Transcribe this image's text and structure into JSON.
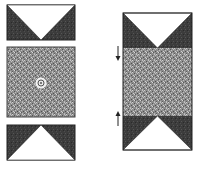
{
  "figure": {
    "width": 209,
    "height": 171,
    "background": "#ffffff",
    "colors": {
      "dark_fill": "#3a3a3a",
      "speckle_base": "#8a8a8a",
      "speckle_light": "#c8c8c8",
      "speckle_dark": "#4a4a4a",
      "light_fill": "#ffffff",
      "stroke": "#222222"
    },
    "left_panel": {
      "top_block": {
        "x": 7,
        "y": 5,
        "w": 68,
        "h": 35,
        "triangle": "down-pointing white"
      },
      "middle_block": {
        "x": 7,
        "y": 47,
        "w": 68,
        "h": 70,
        "fill": "speckled",
        "center_marker": "circle-target"
      },
      "bottom_block": {
        "x": 7,
        "y": 125,
        "w": 68,
        "h": 35,
        "triangle": "up-pointing white"
      }
    },
    "right_panel": {
      "x": 123,
      "y": 13,
      "w": 69,
      "h": 137,
      "top_section": {
        "y": 13,
        "h": 35,
        "triangle": "down-pointing white"
      },
      "middle_section": {
        "y": 48,
        "h": 68,
        "fill": "speckled"
      },
      "bottom_section": {
        "y": 116,
        "h": 34,
        "triangle": "up-pointing white"
      },
      "arrows": [
        {
          "direction": "down",
          "x": 118,
          "y1": 47,
          "y2": 60
        },
        {
          "direction": "up",
          "x": 118,
          "y1": 125,
          "y2": 112
        }
      ]
    }
  }
}
